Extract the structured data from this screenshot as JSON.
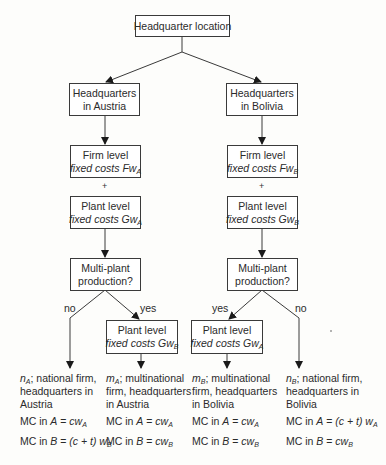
{
  "root": {
    "label": "Headquarter location"
  },
  "branches": [
    {
      "hq": {
        "line1": "Headquarters",
        "line2": "in Austria"
      },
      "firm": {
        "line1": "Firm level",
        "line2": "fixed costs Fw",
        "sub": "A"
      },
      "plus": "+",
      "plant": {
        "line1": "Plant level",
        "line2": "fixed costs Gw",
        "sub": "A"
      },
      "decision": {
        "line1": "Multi-plant",
        "line2": "production?"
      },
      "no_label": "no",
      "yes_label": "yes",
      "extra_plant": {
        "line1": "Plant level",
        "line2": "fixed costs Gw",
        "sub": "B"
      }
    },
    {
      "hq": {
        "line1": "Headquarters",
        "line2": "in Bolivia"
      },
      "firm": {
        "line1": "Firm level",
        "line2": "fixed costs Fw",
        "sub": "B"
      },
      "plus": "+",
      "plant": {
        "line1": "Plant level",
        "line2": "fixed costs Gw",
        "sub": "B"
      },
      "decision": {
        "line1": "Multi-plant",
        "line2": "production?"
      },
      "no_label": "no",
      "yes_label": "yes",
      "extra_plant": {
        "line1": "Plant level",
        "line2": "fixed costs Gw",
        "sub": "A"
      }
    }
  ],
  "outcomes": [
    {
      "var": "n",
      "var_sub": "A",
      "lines": [
        "; national firm,",
        "headquarters in",
        "Austria"
      ],
      "mc_a": {
        "prefix": "MC in ",
        "country": "A",
        "eq": " = ",
        "expr": "cw",
        "sub": "A"
      },
      "mc_b": {
        "prefix": "MC in ",
        "country": "B",
        "eq": " = ",
        "expr": "(c + t) w",
        "sub": "B"
      }
    },
    {
      "var": "m",
      "var_sub": "A",
      "lines": [
        "; multinational",
        "firm, headquarters",
        "in Austria"
      ],
      "mc_a": {
        "prefix": "MC in ",
        "country": "A",
        "eq": " = ",
        "expr": "cw",
        "sub": "A"
      },
      "mc_b": {
        "prefix": "MC in ",
        "country": "B",
        "eq": " = ",
        "expr": "cw",
        "sub": "B"
      }
    },
    {
      "var": "m",
      "var_sub": "B",
      "lines": [
        "; multinational",
        "firm, headquarters",
        "in Bolivia"
      ],
      "mc_a": {
        "prefix": "MC in ",
        "country": "A",
        "eq": " = ",
        "expr": "cw",
        "sub": "A"
      },
      "mc_b": {
        "prefix": "MC in ",
        "country": "B",
        "eq": " = ",
        "expr": "cw",
        "sub": "B"
      }
    },
    {
      "var": "n",
      "var_sub": "B",
      "lines": [
        "; national firm,",
        "headquarters in",
        "Bolivia"
      ],
      "mc_a": {
        "prefix": "MC in ",
        "country": "A",
        "eq": " = ",
        "expr": "(c + t) w",
        "sub": "A"
      },
      "mc_b": {
        "prefix": "MC in ",
        "country": "B",
        "eq": " = ",
        "expr": "cw",
        "sub": "B"
      }
    }
  ]
}
